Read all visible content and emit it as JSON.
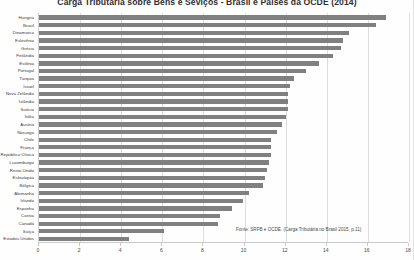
{
  "chart_data": {
    "type": "bar",
    "orientation": "horizontal",
    "title": "Carga Tributária sobre Bens e Seviços - Brasil e Países da OCDE (2014)",
    "xlabel": "",
    "ylabel": "",
    "xlim": [
      0,
      18
    ],
    "xticks": [
      0,
      2,
      4,
      6,
      8,
      10,
      12,
      14,
      16,
      18
    ],
    "grid": true,
    "legend": false,
    "bar_color": "#808080",
    "source_note": "Fonte: SRFB e OCDE. (Carga Tributária no Brasil 2015, p.11)",
    "categories": [
      "Hungria",
      "Brasil",
      "Dinamarca",
      "Eslovênia",
      "Grécia",
      "Finlândia",
      "Estônia",
      "Portugal",
      "Turquia",
      "Israel",
      "Nova Zelândia",
      "Islândia",
      "Suécia",
      "Itália",
      "Áustria",
      "Noruega",
      "Chile",
      "França",
      "República Checa",
      "Luxemburgo",
      "Reino Unido",
      "Eslováquia",
      "Bélgica",
      "Alemanha",
      "Irlanda",
      "Espanha",
      "Coreia",
      "Canadá",
      "Suíça",
      "Estados Unidos"
    ],
    "values": [
      16.9,
      16.4,
      15.1,
      14.8,
      14.7,
      14.3,
      13.6,
      13.0,
      12.4,
      12.2,
      12.1,
      12.1,
      12.1,
      12.0,
      11.8,
      11.6,
      11.3,
      11.3,
      11.3,
      11.2,
      11.1,
      11.0,
      10.9,
      10.2,
      9.9,
      9.4,
      8.8,
      8.7,
      6.1,
      4.4
    ]
  }
}
